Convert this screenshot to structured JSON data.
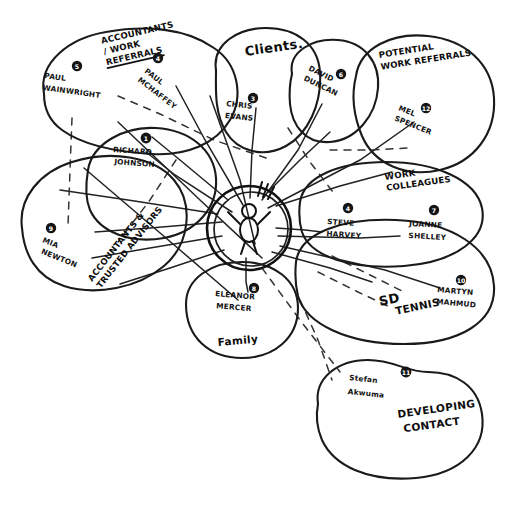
{
  "diagram": {
    "center": {
      "label": "me-stick-figure",
      "icon": "person-icon"
    },
    "groups": [
      {
        "id": "accountants-work-referrals",
        "label": "ACCOUNTANTS / WORK REFERRALS",
        "label_line1": "ACCOUNTANTS",
        "label_line2": "/ WORK",
        "label_line3": "REFERRALS",
        "underlined": true
      },
      {
        "id": "clients",
        "label": "Clients.",
        "label_line1": "Clients.",
        "label_line2": "",
        "label_line3": "",
        "underlined": false
      },
      {
        "id": "potential-work-referrals",
        "label": "POTENTIAL WORK REFERRALS",
        "label_line1": "POTENTIAL",
        "label_line2": "WORK REFERRALS",
        "label_line3": "",
        "underlined": false
      },
      {
        "id": "work-colleagues",
        "label": "WORK COLLEAGUES",
        "label_line1": "WORK",
        "label_line2": "COLLEAGUES",
        "label_line3": "",
        "underlined": false
      },
      {
        "id": "accountants-trusted-advisors",
        "label": "ACCOUNTANTS & TRUSTED ADVISORS",
        "label_line1": "ACCOUNTANTS &",
        "label_line2": "TRUSTED ADVISORS",
        "label_line3": "",
        "underlined": false
      },
      {
        "id": "family",
        "label": "Family",
        "label_line1": "Family",
        "label_line2": "",
        "label_line3": "",
        "underlined": false
      },
      {
        "id": "sd-tennis",
        "label": "SD TENNIS",
        "label_line1": "SD",
        "label_line2": "TENNIS",
        "label_line3": "",
        "underlined": false
      },
      {
        "id": "developing-contact",
        "label": "DEVELOPING CONTACT",
        "label_line1": "DEVELOPING",
        "label_line2": "CONTACT",
        "label_line3": "",
        "underlined": false
      }
    ],
    "people": [
      {
        "id": "paul-wainwright",
        "badge": "5",
        "name_line1": "PAUL",
        "name_line2": "WAINWRIGHT",
        "group": "accountants-work-referrals"
      },
      {
        "id": "paul-mchaffey",
        "badge": "4",
        "name_line1": "PAUL",
        "name_line2": "MCHAFFEY",
        "group": "accountants-work-referrals"
      },
      {
        "id": "richard-johnson",
        "badge": "1",
        "name_line1": "RICHARD",
        "name_line2": "JOHNSON",
        "group": "accountants-trusted-advisors"
      },
      {
        "id": "mia-newton",
        "badge": "9",
        "name_line1": "MIA",
        "name_line2": "NEWTON",
        "group": "accountants-trusted-advisors"
      },
      {
        "id": "chris-evans",
        "badge": "3",
        "name_line1": "CHRIS",
        "name_line2": "EVANS",
        "group": "clients"
      },
      {
        "id": "david-duncan",
        "badge": "6",
        "name_line1": "DAVID",
        "name_line2": "DUNCAN",
        "group": "clients"
      },
      {
        "id": "mel-spencer",
        "badge": "12",
        "name_line1": "MEL",
        "name_line2": "SPENCER",
        "group": "potential-work-referrals"
      },
      {
        "id": "steve-harvey",
        "badge": "4",
        "name_line1": "STEVE",
        "name_line2": "HARVEY",
        "group": "work-colleagues"
      },
      {
        "id": "joanne-shelley",
        "badge": "7",
        "name_line1": "JOANNE",
        "name_line2": "SHELLEY",
        "group": "work-colleagues"
      },
      {
        "id": "martyn-mahmud",
        "badge": "10",
        "name_line1": "MARTYN",
        "name_line2": "MAHMUD",
        "group": "sd-tennis"
      },
      {
        "id": "eleanor-mercer",
        "badge": "8",
        "name_line1": "ELEANOR",
        "name_line2": "MERCER",
        "group": "family"
      },
      {
        "id": "stefan-akwuma",
        "badge": "11",
        "name_line1": "Stefan",
        "name_line2": "Akwuma",
        "group": "developing-contact"
      }
    ],
    "colors": {
      "ink": "#1a1a1a",
      "paper": "#ffffff",
      "badge_fill": "#141414",
      "badge_text": "#ffffff"
    }
  }
}
